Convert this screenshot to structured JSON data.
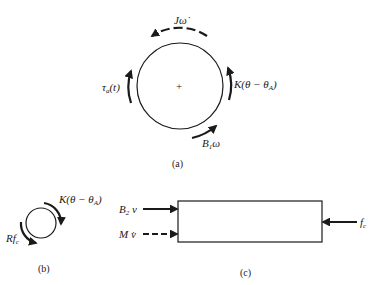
{
  "figure": {
    "panel_a": {
      "caption": "(a)",
      "labels": {
        "inertia_torque": "Jω̇",
        "spring_torque": "K(θ − θA)",
        "applied_torque": "τa(t)",
        "damping_torque": "B1ω"
      },
      "center_mark": "+"
    },
    "panel_b": {
      "caption": "(b)",
      "labels": {
        "spring_torque": "K(θ − θA)",
        "force_torque": "Rfc"
      }
    },
    "panel_c": {
      "caption": "(c)",
      "labels": {
        "damping_force": "B2 v",
        "inertia_force": "M v̇",
        "contact_force": "fc"
      }
    }
  }
}
